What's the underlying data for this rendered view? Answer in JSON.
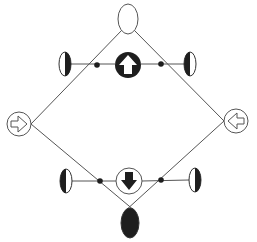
{
  "diagram": {
    "type": "symmetric-diamond-symbol-diagram",
    "colors": {
      "background": "#ffffff",
      "line": "#555555",
      "fill_dark": "#1e1e1e",
      "fill_light": "#ffffff"
    },
    "nodes": [
      {
        "id": "top-ellipse",
        "shape": "ellipse",
        "fill": "white",
        "cx": 128,
        "cy": 19,
        "rx": 10,
        "ry": 16
      },
      {
        "id": "bottom-ellipse",
        "shape": "ellipse",
        "fill": "dark",
        "cx": 130,
        "cy": 222,
        "rx": 9,
        "ry": 15
      },
      {
        "id": "up-arrow-circle",
        "shape": "circle",
        "fill": "dark",
        "glyph": "up-arrow-white",
        "cx": 128,
        "cy": 65,
        "r": 13
      },
      {
        "id": "down-arrow-circle",
        "shape": "circle",
        "fill": "white",
        "glyph": "down-arrow-dark",
        "cx": 129,
        "cy": 181,
        "r": 13
      },
      {
        "id": "left-arrow-circle",
        "shape": "circle",
        "fill": "white",
        "glyph": "right-arrow-outline",
        "cx": 19,
        "cy": 124,
        "r": 13
      },
      {
        "id": "right-arrow-circle",
        "shape": "circle",
        "fill": "white",
        "glyph": "left-arrow-outline",
        "cx": 236,
        "cy": 121,
        "r": 13
      },
      {
        "id": "half-moon-top-left",
        "shape": "half-ellipse",
        "dark_side": "right",
        "cx": 65,
        "cy": 64
      },
      {
        "id": "half-moon-top-right",
        "shape": "half-ellipse",
        "dark_side": "left",
        "cx": 190,
        "cy": 64
      },
      {
        "id": "half-moon-bottom-left",
        "shape": "half-ellipse",
        "dark_side": "left",
        "cx": 66,
        "cy": 181
      },
      {
        "id": "half-moon-bottom-right",
        "shape": "half-ellipse",
        "dark_side": "right",
        "cx": 195,
        "cy": 180
      },
      {
        "id": "dot-top-left",
        "shape": "dot",
        "cx": 97,
        "cy": 65
      },
      {
        "id": "dot-top-right",
        "shape": "dot",
        "cx": 161,
        "cy": 64
      },
      {
        "id": "dot-bottom-left",
        "shape": "dot",
        "cx": 100,
        "cy": 181
      },
      {
        "id": "dot-bottom-right",
        "shape": "dot",
        "cx": 161,
        "cy": 180
      }
    ]
  }
}
